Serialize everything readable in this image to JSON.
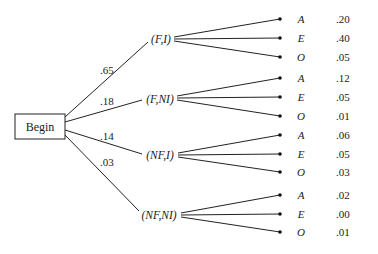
{
  "root": {
    "label": "Begin"
  },
  "branches": [
    {
      "label": "(F,I)",
      "prob": ".65",
      "outcomes": [
        {
          "label": "A",
          "value": ".20"
        },
        {
          "label": "E",
          "value": ".40"
        },
        {
          "label": "O",
          "value": ".05"
        }
      ]
    },
    {
      "label": "(F,NI)",
      "prob": ".18",
      "outcomes": [
        {
          "label": "A",
          "value": ".12"
        },
        {
          "label": "E",
          "value": ".05"
        },
        {
          "label": "O",
          "value": ".01"
        }
      ]
    },
    {
      "label": "(NF,I)",
      "prob": ".14",
      "outcomes": [
        {
          "label": "A",
          "value": ".06"
        },
        {
          "label": "E",
          "value": ".05"
        },
        {
          "label": "O",
          "value": ".03"
        }
      ]
    },
    {
      "label": "(NF,NI)",
      "prob": ".03",
      "outcomes": [
        {
          "label": "A",
          "value": ".02"
        },
        {
          "label": "E",
          "value": ".00"
        },
        {
          "label": "O",
          "value": ".01"
        }
      ]
    }
  ]
}
